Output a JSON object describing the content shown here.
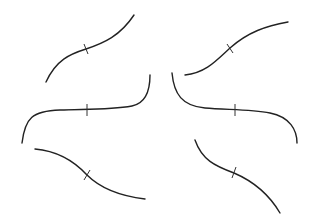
{
  "diagram": {
    "background": "#ffffff",
    "stroke_color": "#222222",
    "curves": [
      {
        "name": "top-left-increasing",
        "path": "M46,82 C56,60 70,54 86,49 C104,43 120,36 134,15",
        "tick": {
          "x1": 84,
          "y1": 44,
          "x2": 88,
          "y2": 54
        }
      },
      {
        "name": "top-right-increasing",
        "path": "M185,75 C205,73 215,62 230,48 C248,32 266,26 288,22",
        "tick": {
          "x1": 227,
          "y1": 44,
          "x2": 233,
          "y2": 53
        }
      },
      {
        "name": "middle-left-flat-increasing",
        "path": "M22,143 C25,118 32,111 60,110 C85,109 110,110 132,106 C147,103 150,88 150,75",
        "tick": {
          "x1": 87,
          "y1": 104,
          "x2": 87,
          "y2": 116
        }
      },
      {
        "name": "middle-right-flat-decreasing",
        "path": "M172,73 C174,94 182,106 205,108 C225,110 250,109 270,113 C290,117 297,130 297,143",
        "tick": {
          "x1": 235,
          "y1": 104,
          "x2": 235,
          "y2": 116
        }
      },
      {
        "name": "bottom-left-decreasing",
        "path": "M35,149 C58,151 75,162 87,175 C100,188 120,196 145,199",
        "tick": {
          "x1": 84,
          "y1": 180,
          "x2": 90,
          "y2": 170
        }
      },
      {
        "name": "bottom-right-decreasing",
        "path": "M195,140 C202,160 215,166 234,173 C255,182 270,196 280,213",
        "tick": {
          "x1": 232,
          "y1": 178,
          "x2": 236,
          "y2": 167
        }
      }
    ]
  }
}
